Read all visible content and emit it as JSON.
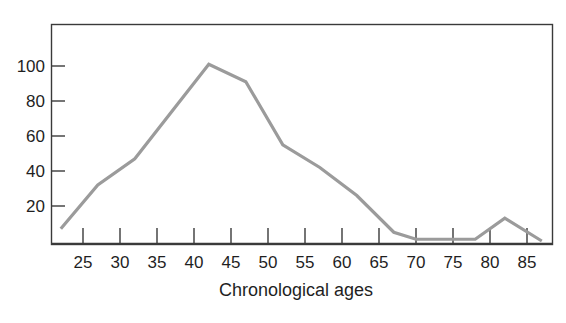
{
  "chart_data": {
    "type": "line",
    "title": "",
    "subtitle": "",
    "xlabel": "Chronological ages",
    "ylabel": "",
    "xlim": [
      21,
      89
    ],
    "ylim": [
      0,
      118
    ],
    "grid": false,
    "legend": null,
    "x_ticks": [
      25,
      30,
      35,
      40,
      45,
      50,
      55,
      60,
      65,
      70,
      75,
      80,
      85
    ],
    "x_tick_labels": [
      "25",
      "30",
      "35",
      "40",
      "45",
      "50",
      "55",
      "60",
      "65",
      "70",
      "75",
      "80",
      "85"
    ],
    "y_ticks": [
      20,
      40,
      60,
      80,
      100
    ],
    "y_tick_labels": [
      "20",
      "40",
      "60",
      "80",
      "100"
    ],
    "line_color": "#9b9b9b",
    "axis_color": "#3a3a3a",
    "series": [
      {
        "name": "frequency",
        "x": [
          22,
          27,
          32,
          37,
          42,
          47,
          52,
          57,
          62,
          67,
          70,
          75,
          78,
          82,
          87
        ],
        "values": [
          7,
          32,
          47,
          74,
          101,
          91,
          55,
          42,
          26,
          5,
          1,
          1,
          1,
          13,
          0
        ]
      }
    ]
  },
  "figure": {
    "caption": ""
  }
}
